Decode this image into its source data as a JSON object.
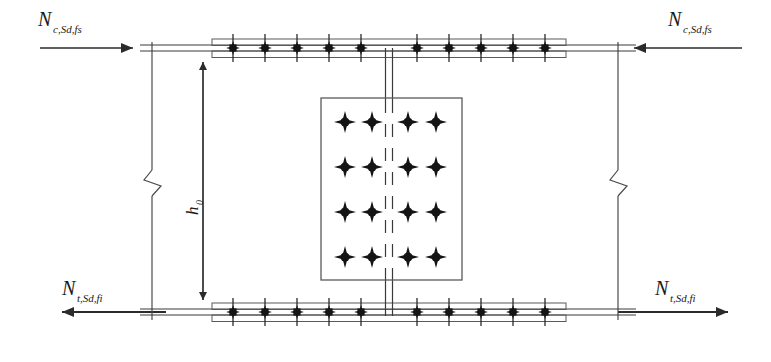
{
  "figure": {
    "type": "engineering-diagram",
    "width": 771,
    "height": 362,
    "background_color": "#ffffff",
    "line_color": "#3a3a3a",
    "bolt_color": "#1a1a1a",
    "plate_fill": "#ffffff"
  },
  "labels": {
    "top_left_force": {
      "symbol": "N",
      "subscript": "c,Sd,fs"
    },
    "top_right_force": {
      "symbol": "N",
      "subscript": "c,Sd,fs"
    },
    "bottom_left_force": {
      "symbol": "N",
      "subscript": "t,Sd,fi"
    },
    "bottom_right_force": {
      "symbol": "N",
      "subscript": "t,Sd,fi"
    },
    "dimension": {
      "symbol": "h",
      "subscript": "0"
    }
  },
  "arrows": {
    "top_left": {
      "direction": "right",
      "x1": 40,
      "x2": 140,
      "y": 48
    },
    "top_right": {
      "direction": "left",
      "x1": 740,
      "x2": 625,
      "y": 48
    },
    "bottom_left": {
      "direction": "left",
      "x1": 165,
      "x2": 55,
      "y": 312
    },
    "bottom_right": {
      "direction": "right",
      "x1": 620,
      "x2": 735,
      "y": 312
    }
  },
  "dimension_line": {
    "x": 203,
    "y_top": 52,
    "y_bottom": 310,
    "arrow_top": "up",
    "arrow_bottom": "down"
  },
  "break_symbols": [
    {
      "name": "left-break",
      "x": 152,
      "y": 178
    },
    {
      "name": "right-break",
      "x": 618,
      "y": 178
    }
  ],
  "cut_lines": [
    {
      "name": "left-cut-line",
      "x": 152,
      "y1": 42,
      "y2": 320
    },
    {
      "name": "right-cut-line",
      "x": 618,
      "y1": 42,
      "y2": 320
    }
  ],
  "web": {
    "center_x": 389,
    "half_width": 3.5,
    "y_top": 48,
    "y_bottom": 314,
    "dash_y_top": 100,
    "dash_y_bottom": 276
  },
  "flanges": {
    "top": {
      "name": "top-flange",
      "y": 48,
      "x_left": 152,
      "x_right": 630,
      "cover_plate": {
        "x_left": 212,
        "x_right": 566,
        "y_top": 41,
        "y_bottom": 55
      },
      "bolt_count": 10,
      "bolt_xs": [
        233,
        265,
        297,
        329,
        361,
        417,
        449,
        481,
        513,
        545
      ],
      "bolt_y": 48
    },
    "bottom": {
      "name": "bottom-flange",
      "y": 312,
      "x_left": 152,
      "x_right": 630,
      "cover_plate": {
        "x_left": 212,
        "x_right": 566,
        "y_top": 305,
        "y_bottom": 319
      },
      "bolt_count": 10,
      "bolt_xs": [
        233,
        265,
        297,
        329,
        361,
        417,
        449,
        481,
        513,
        545
      ],
      "bolt_y": 312
    }
  },
  "web_plate": {
    "name": "web-cover-plate",
    "x_left": 321,
    "x_right": 462,
    "y_top": 98,
    "y_bottom": 280,
    "bolt_rows": 4,
    "bolt_cols": 4,
    "bolt_xs": [
      345,
      372,
      408,
      436
    ],
    "bolt_ys": [
      122,
      167,
      212,
      257
    ]
  },
  "bolt_symbol": {
    "style": "four-point-star",
    "flange_size": 6,
    "plate_size": 9
  }
}
